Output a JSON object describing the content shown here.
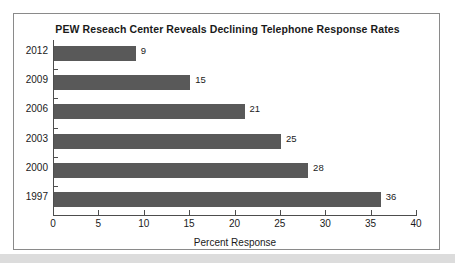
{
  "chart_data": {
    "type": "bar",
    "orientation": "horizontal",
    "title": "PEW Reseach Center Reveals Declining Telephone Response Rates",
    "xlabel": "Percent Response",
    "ylabel": "",
    "categories": [
      "2012",
      "2009",
      "2006",
      "2003",
      "2000",
      "1997"
    ],
    "values": [
      9,
      15,
      21,
      25,
      28,
      36
    ],
    "value_labels": [
      "9",
      "15",
      "21",
      "25",
      "28",
      "36"
    ],
    "xlim": [
      0,
      40
    ],
    "xticks": [
      0,
      5,
      10,
      15,
      20,
      25,
      30,
      35,
      40
    ],
    "xtick_labels": [
      "0",
      "5",
      "10",
      "15",
      "20",
      "25",
      "30",
      "35",
      "40"
    ],
    "grid": false,
    "legend": null,
    "bar_color": "#595959",
    "axis_color": "#4d4d4d",
    "frame_color": "#8a8a8a",
    "background": "#ffffff"
  }
}
